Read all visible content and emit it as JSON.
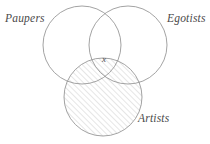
{
  "figure": {
    "type": "venn-diagram",
    "set_count": 3,
    "width": 210,
    "height": 144,
    "background_color": "#ffffff",
    "stroke_color": "#8c8c8c",
    "text_color": "#4a4a4a",
    "hatch_color": "#a9a9a9"
  },
  "sets": [
    {
      "id": "paupers",
      "label": "Paupers",
      "position": "top-left",
      "cx": 82,
      "cy": 45,
      "r": 39,
      "shaded": false
    },
    {
      "id": "egotists",
      "label": "Egotists",
      "position": "top-right",
      "cx": 128,
      "cy": 45,
      "r": 39,
      "shaded": false
    },
    {
      "id": "artists",
      "label": "Artists",
      "position": "bottom-center",
      "cx": 103,
      "cy": 97,
      "r": 39,
      "shaded": true,
      "shading": "diagonal-hatch"
    }
  ],
  "markers": [
    {
      "id": "triple-intersection-x",
      "text": "x",
      "region": "paupers-egotists-artists",
      "cx": 105,
      "cy": 60
    }
  ],
  "hatch": {
    "angle_degrees": 45,
    "direction": "lower-left-to-upper-right",
    "spacing_px": 4,
    "line_width_px": 0.6
  }
}
